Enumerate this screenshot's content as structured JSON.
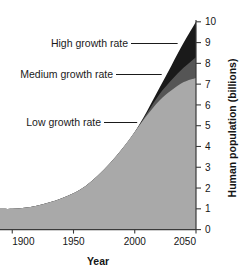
{
  "chart_data": {
    "type": "area",
    "title": "",
    "subtitle": "",
    "xlabel": "Year",
    "ylabel": "Human population (billions)",
    "xlim": [
      1890,
      2050
    ],
    "ylim": [
      0,
      10
    ],
    "grid": false,
    "legend_position": "inline-annotations",
    "x_ticks": [
      1900,
      1950,
      2000,
      2050
    ],
    "x_tick_labels": [
      "1900",
      "1950",
      "2000",
      "2050"
    ],
    "y_ticks": [
      0,
      1,
      2,
      3,
      4,
      5,
      6,
      7,
      8,
      9,
      10
    ],
    "y_tick_labels": [
      "0",
      "1",
      "2",
      "3",
      "4",
      "5",
      "6",
      "7",
      "8",
      "9",
      "10"
    ],
    "x": [
      1890,
      1900,
      1910,
      1920,
      1930,
      1940,
      1950,
      1960,
      1970,
      1980,
      1990,
      2000,
      2010,
      2020,
      2030,
      2040,
      2050
    ],
    "series": [
      {
        "name": "Low growth rate",
        "color": "#a9a9a9",
        "values": [
          1.0,
          1.0,
          1.05,
          1.15,
          1.3,
          1.5,
          1.75,
          2.1,
          2.6,
          3.2,
          3.9,
          4.7,
          5.5,
          6.2,
          6.7,
          7.1,
          7.3
        ]
      },
      {
        "name": "Medium growth rate",
        "color": "#555555",
        "values": [
          1.0,
          1.0,
          1.05,
          1.15,
          1.3,
          1.5,
          1.75,
          2.1,
          2.6,
          3.2,
          3.9,
          4.7,
          5.6,
          6.5,
          7.2,
          7.8,
          8.3
        ]
      },
      {
        "name": "High growth rate",
        "color": "#1a1a1a",
        "values": [
          1.0,
          1.0,
          1.05,
          1.15,
          1.3,
          1.5,
          1.75,
          2.1,
          2.6,
          3.2,
          3.9,
          4.7,
          5.7,
          6.8,
          7.9,
          9.0,
          10.0
        ]
      }
    ],
    "annotations": [
      {
        "text": "High growth rate",
        "target_year": 2035,
        "target_value": 8.9
      },
      {
        "text": "Medium growth rate",
        "target_year": 2022,
        "target_value": 7.0
      },
      {
        "text": "Low growth rate",
        "target_year": 2002,
        "target_value": 5.0
      }
    ],
    "colors": {
      "low": "#a9a9a9",
      "medium": "#555555",
      "high": "#1a1a1a",
      "axis": "#3a3a3a",
      "text": "#151515",
      "background": "#ffffff"
    }
  }
}
